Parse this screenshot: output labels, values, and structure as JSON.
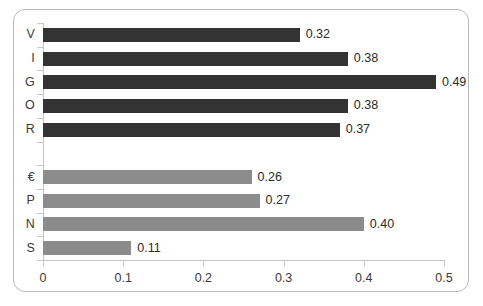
{
  "chart_data": {
    "type": "bar",
    "orientation": "horizontal",
    "title": "",
    "xlabel": "",
    "ylabel": "",
    "xlim": [
      0,
      0.5
    ],
    "xticks": [
      "0",
      "0.1",
      "0.2",
      "0.3",
      "0.4",
      "0.5"
    ],
    "xtick_values": [
      0,
      0.1,
      0.2,
      0.3,
      0.4,
      0.5
    ],
    "grid": false,
    "legend": "none",
    "group_gap_after_index": 4,
    "colors": {
      "group_1": "#333333",
      "group_2": "#8c8c8c",
      "axis": "#c4c4c4",
      "border": "#b9b9b9",
      "text": "#3a3a3a",
      "background": "#ffffff"
    },
    "categories": [
      "V",
      "I",
      "G",
      "O",
      "R",
      "",
      "€",
      "P",
      "N",
      "S"
    ],
    "values": [
      0.32,
      0.38,
      0.49,
      0.38,
      0.37,
      null,
      0.26,
      0.27,
      0.4,
      0.11
    ],
    "labels": [
      "0.32",
      "0.38",
      "0.49",
      "0.38",
      "0.37",
      "",
      "0.26",
      "0.27",
      "0.40",
      "0.11"
    ],
    "bars": [
      {
        "category": "V",
        "value": 0.32,
        "label": "0.32",
        "group": 1
      },
      {
        "category": "I",
        "value": 0.38,
        "label": "0.38",
        "group": 1
      },
      {
        "category": "G",
        "value": 0.49,
        "label": "0.49",
        "group": 1
      },
      {
        "category": "O",
        "value": 0.38,
        "label": "0.38",
        "group": 1
      },
      {
        "category": "R",
        "value": 0.37,
        "label": "0.37",
        "group": 1
      },
      {
        "category": "€",
        "value": 0.26,
        "label": "0.26",
        "group": 2
      },
      {
        "category": "P",
        "value": 0.27,
        "label": "0.27",
        "group": 2
      },
      {
        "category": "N",
        "value": 0.4,
        "label": "0.40",
        "group": 2
      },
      {
        "category": "S",
        "value": 0.11,
        "label": "0.11",
        "group": 2
      }
    ]
  }
}
